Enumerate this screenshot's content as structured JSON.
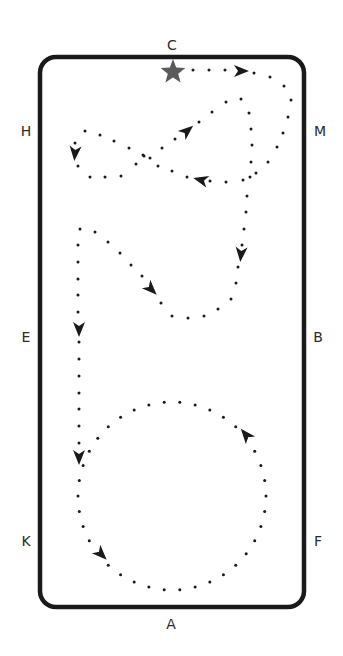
{
  "diagram": {
    "arena": {
      "x": 40,
      "y": 57,
      "width": 264,
      "height": 550,
      "radius": 16,
      "stroke": "#1a1a1a",
      "stroke_width": 4.5
    },
    "letters": [
      {
        "id": "C",
        "label": "C",
        "x": 172,
        "y": 45
      },
      {
        "id": "H",
        "label": "H",
        "x": 26,
        "y": 131
      },
      {
        "id": "M",
        "label": "M",
        "x": 320,
        "y": 131
      },
      {
        "id": "E",
        "label": "E",
        "x": 26,
        "y": 337
      },
      {
        "id": "B",
        "label": "B",
        "x": 318,
        "y": 337
      },
      {
        "id": "K",
        "label": "K",
        "x": 26,
        "y": 541
      },
      {
        "id": "F",
        "label": "F",
        "x": 318,
        "y": 541
      },
      {
        "id": "A",
        "label": "A",
        "x": 171,
        "y": 624
      }
    ],
    "start_marker": {
      "type": "star",
      "x": 173,
      "y": 72,
      "color": "#5a5a5a",
      "size": 13
    },
    "dot_color": "#1a1a1a",
    "arrow_color": "#1a1a1a",
    "path_dots": [
      [
        193,
        70
      ],
      [
        209,
        70
      ],
      [
        225,
        70
      ],
      [
        254,
        73
      ],
      [
        270,
        77
      ],
      [
        284,
        86
      ],
      [
        291,
        100
      ],
      [
        288,
        117
      ],
      [
        283,
        133
      ],
      [
        277,
        147
      ],
      [
        268,
        162
      ],
      [
        256,
        173
      ],
      [
        243,
        180
      ],
      [
        226,
        182
      ],
      [
        210,
        181
      ],
      [
        187,
        177
      ],
      [
        172,
        171
      ],
      [
        158,
        166
      ],
      [
        150,
        158
      ],
      [
        144,
        156
      ],
      [
        136,
        164
      ],
      [
        121,
        176
      ],
      [
        105,
        177
      ],
      [
        90,
        177
      ],
      [
        78,
        166
      ],
      [
        75,
        143
      ],
      [
        85,
        131
      ],
      [
        100,
        135
      ],
      [
        114,
        141
      ],
      [
        129,
        148
      ],
      [
        143,
        155
      ],
      [
        162,
        148
      ],
      [
        175,
        139
      ],
      [
        199,
        122
      ],
      [
        212,
        112
      ],
      [
        226,
        102
      ],
      [
        241,
        99
      ],
      [
        249,
        113
      ],
      [
        251,
        129
      ],
      [
        252,
        145
      ],
      [
        251,
        162
      ],
      [
        250,
        177
      ],
      [
        247,
        196
      ],
      [
        246,
        212
      ],
      [
        244,
        229
      ],
      [
        242,
        245
      ],
      [
        238,
        267
      ],
      [
        236,
        283
      ],
      [
        231,
        299
      ],
      [
        218,
        309
      ],
      [
        204,
        316
      ],
      [
        188,
        318
      ],
      [
        172,
        316
      ],
      [
        161,
        303
      ],
      [
        142,
        276
      ],
      [
        131,
        265
      ],
      [
        120,
        253
      ],
      [
        108,
        242
      ],
      [
        95,
        232
      ],
      [
        80,
        229
      ],
      [
        78,
        245
      ],
      [
        78,
        262
      ],
      [
        78,
        279
      ],
      [
        78,
        295
      ],
      [
        78,
        312
      ],
      [
        79,
        342
      ],
      [
        79,
        359
      ],
      [
        79,
        376
      ],
      [
        79,
        393
      ],
      [
        79,
        409
      ],
      [
        79,
        426
      ],
      [
        79,
        443
      ]
    ],
    "circle": {
      "cx": 172,
      "cy": 496,
      "r": 94,
      "dot_count": 38
    },
    "arrows": [
      {
        "x": 241,
        "y": 71,
        "angle": 0
      },
      {
        "x": 201,
        "y": 180,
        "angle": 195
      },
      {
        "x": 75,
        "y": 153,
        "angle": 95
      },
      {
        "x": 187,
        "y": 131,
        "angle": -40
      },
      {
        "x": 241,
        "y": 254,
        "angle": 95
      },
      {
        "x": 151,
        "y": 289,
        "angle": 45
      },
      {
        "x": 79,
        "y": 329,
        "angle": 90
      },
      {
        "x": 79,
        "y": 457,
        "angle": 90
      },
      {
        "x": 101,
        "y": 554,
        "angle": 45
      },
      {
        "x": 246,
        "y": 435,
        "angle": -130
      }
    ]
  }
}
